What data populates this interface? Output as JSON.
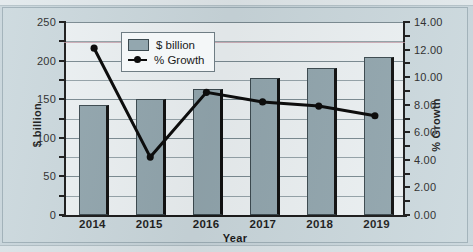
{
  "chart_data": {
    "type": "bar",
    "title": "",
    "xlabel": "Year",
    "ylabel": "$ billion",
    "y2label": "% Growth",
    "categories": [
      "2014",
      "2015",
      "2016",
      "2017",
      "2018",
      "2019"
    ],
    "ylim": [
      0,
      250
    ],
    "y2lim": [
      0,
      14
    ],
    "yticks": [
      "0",
      "50",
      "100",
      "150",
      "200",
      "250"
    ],
    "y2ticks": [
      "0.00",
      "2.00",
      "4.00",
      "6.00",
      "8.00",
      "10.00",
      "12.00",
      "14.00"
    ],
    "grid": true,
    "legend_position": "upper-center-inside",
    "series": [
      {
        "name": "$ billion",
        "type": "bar",
        "axis": "left",
        "color": "#93a7af",
        "edge_color": "#3c4a50",
        "values": [
          142,
          150,
          163,
          177,
          190,
          205
        ]
      },
      {
        "name": "% Growth",
        "type": "line",
        "axis": "right",
        "color": "#0d0d0d",
        "marker": "circle",
        "values": [
          12.1,
          4.2,
          8.9,
          8.2,
          7.9,
          7.2
        ]
      }
    ]
  },
  "legend": {
    "items": [
      {
        "label": "$ billion",
        "icon": "bar-swatch"
      },
      {
        "label": "% Growth",
        "icon": "line-marker-swatch"
      }
    ]
  },
  "axes": {
    "left": {
      "title": "$ billion",
      "labels": [
        "250",
        "200",
        "150",
        "100",
        "50",
        "0"
      ]
    },
    "right": {
      "title": "% Growth",
      "labels": [
        "14.00",
        "12.00",
        "10.00",
        "8.00",
        "6.00",
        "4.00",
        "2.00",
        "0.00"
      ]
    },
    "bottom": {
      "title": "Year",
      "labels": [
        "2014",
        "2015",
        "2016",
        "2017",
        "2018",
        "2019"
      ]
    }
  },
  "colors": {
    "page_background": "#c9d6dc",
    "chart_background": "#ccd9de",
    "plot_background": "#edf2f4",
    "bar_fill": "#93a7af",
    "line": "#0d0d0d",
    "grid": "#7b8b92"
  }
}
